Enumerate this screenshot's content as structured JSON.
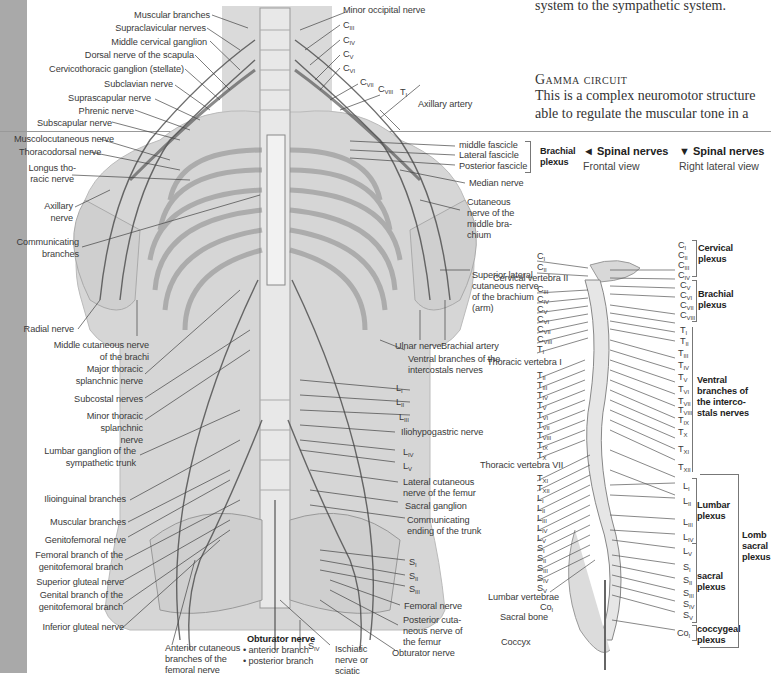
{
  "page": {
    "text_top": "system to the sympathetic system.",
    "section_title": "Gamma circuit",
    "section_body": [
      "This is a complex neuromotor structure",
      "able to regulate the muscular tone in a"
    ]
  },
  "headers": {
    "frontal": {
      "arrow": "◄",
      "title": "Spinal nerves",
      "subtitle": "Frontal view"
    },
    "lateral": {
      "arrow": "▼",
      "title": "Spinal nerves",
      "subtitle": "Right lateral view"
    }
  },
  "colors": {
    "sidebar": "#a9a9a9",
    "figure_bg": "#d9d9d9",
    "nerve": "#4a4a4a",
    "text": "#3a3a3a"
  },
  "frontal_labels_left": [
    "Muscular branches",
    "Supraclavicular nerves",
    "Middle cervical ganglion",
    "Dorsal nerve of the scapula",
    "Cervicothoracic ganglion (stellate)",
    "Subclavian nerve",
    "Suprascapular nerve",
    "Phrenic nerve",
    "Subscapular nerve",
    "Muscolocutaneous nerve",
    "Thoracodorsal nerve",
    "Longus tho-",
    "racic nerve",
    "Axillary",
    "nerve",
    "Communicating",
    "branches",
    "Radial nerve",
    "Middle cutaneous nerve",
    "of the brachi",
    "Major thoracic",
    "splanchnic nerve",
    "Subcostal nerves",
    "Minor thoracic",
    "splanchnic",
    "nerve",
    "Lumbar ganglion of the",
    "sympathetic trunk",
    "Ilioinguinal branches",
    "Muscular branches",
    "Genitofemoral nerve",
    "Femoral branch of the",
    "genitofemoral branch",
    "Superior gluteal nerve",
    "Genital branch of the",
    "genitofemoral branch",
    "Inferior gluteal nerve"
  ],
  "frontal_labels_bottom": {
    "anterior_cutaneous": [
      "Anterior cutaneous",
      "branches of the",
      "femoral nerve"
    ],
    "obturator_title": "Obturator nerve",
    "obturator_anterior": "anterior branch",
    "obturator_posterior": "posterior branch",
    "s_iv": "IV",
    "ischiatic": [
      "Ischiatic",
      "nerve or",
      "sciatic"
    ]
  },
  "frontal_labels_right": {
    "minor_occipital": "Minor occipital nerve",
    "c_levels": [
      "III",
      "IV",
      "V",
      "VI",
      "VII",
      "VIII"
    ],
    "t1": "I",
    "axillary_artery": "Axillary artery",
    "middle_fascicle": "middle fascicle",
    "lateral_fascicle": "Lateral fascicle",
    "posterior_fascicle": "Posterior fascicle",
    "brachial_plexus": [
      "Brachial",
      "plexus"
    ],
    "median_nerve": "Median nerve",
    "cutaneous_middle": [
      "Cutaneous",
      "nerve of the",
      "middle bra-",
      "chium"
    ],
    "superior_lateral": [
      "Superior lateral",
      "cutaneous nerve",
      "of the brachium",
      "(arm)"
    ],
    "ulnar_nerve": "Ulnar nerve",
    "brachial_artery": "Brachial artery",
    "ventral_branches": [
      "Ventral branches of the",
      "intercostals nerves"
    ],
    "l_levels": [
      "I",
      "II",
      "III"
    ],
    "iliohypogastric": "Iliohypogastric nerve",
    "l_levels_2": [
      "IV",
      "V"
    ],
    "lateral_cutaneous": [
      "Lateral cutaneous",
      "nerve of the femur"
    ],
    "sacral_ganglion": "Sacral ganglion",
    "communicating_ending": [
      "Communicating",
      "ending of the trunk"
    ],
    "s_levels": [
      "I",
      "II",
      "III"
    ],
    "femoral_nerve": "Femoral nerve",
    "posterior_cutaneous": [
      "Posterior cuta-",
      "neous nerve of",
      "the femur"
    ],
    "obturator_nerve": "Obturator nerve"
  },
  "lateral_labels_left": {
    "c1": "I",
    "c2": "II",
    "cervical_vertebra": "Cervical vertebra II",
    "c_levels": [
      "III",
      "IV",
      "V",
      "VI",
      "VII",
      "VIII"
    ],
    "t1": "I",
    "thoracic_vertebra_i": "Thoracic vertebra I",
    "t_levels": [
      "II",
      "III",
      "IV",
      "V",
      "VI",
      "VII",
      "VIII",
      "IX",
      "X"
    ],
    "thoracic_vertebra_vii": "Thoracic vertebra VII",
    "t_levels_2": [
      "XI",
      "XII"
    ],
    "l_levels": [
      "I",
      "II",
      "III",
      "IV",
      "V"
    ],
    "s_levels": [
      "I",
      "II",
      "III",
      "IV",
      "V"
    ],
    "lumbar_vertebrae": "Lumbar vertebrae",
    "co1": "I",
    "sacral_bone": "Sacral bone",
    "coccyx": "Coccyx"
  },
  "lateral_labels_right": {
    "c_levels": [
      "I",
      "II",
      "III",
      "IV"
    ],
    "cervical_plexus": [
      "Cervical",
      "plexus"
    ],
    "c_levels_2": [
      "V",
      "VI",
      "VII",
      "VIII"
    ],
    "brachial_plexus": [
      "Brachial",
      "plexus"
    ],
    "t_levels": [
      "I",
      "II",
      "III",
      "IV",
      "V",
      "VI",
      "VII",
      "VIII",
      "IX",
      "X",
      "XI",
      "XII"
    ],
    "ventral_branches": [
      "Ventral",
      "branches of",
      "the interco-",
      "stals nerves"
    ],
    "l_levels": [
      "I",
      "II",
      "III",
      "IV"
    ],
    "lumbar_plexus": [
      "Lumbar",
      "plexus"
    ],
    "l_v": "V",
    "s_levels": [
      "I",
      "II",
      "III",
      "IV",
      "V"
    ],
    "sacral_plexus": [
      "sacral",
      "plexus"
    ],
    "co1": "I",
    "coccygeal_plexus": [
      "coccygeal",
      "plexus"
    ],
    "lomb_sacral": [
      "Lomb",
      "sacral",
      "plexus"
    ]
  }
}
